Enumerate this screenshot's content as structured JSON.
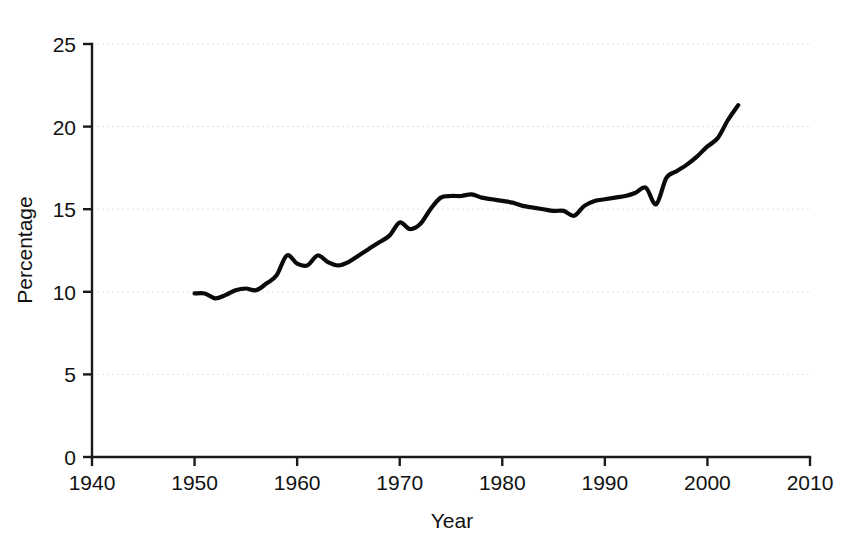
{
  "figure": {
    "caption_fragment": "",
    "background_color": "#ffffff",
    "line_color": "#0a0a0a",
    "grid_color": "#d8d8d8",
    "axis_color": "#1a1a1a"
  },
  "axes": {
    "x_title": "Year",
    "y_title": "Percentage",
    "x_ticks": [
      "1940",
      "1950",
      "1960",
      "1970",
      "1980",
      "1990",
      "2000",
      "2010"
    ],
    "y_ticks": [
      "0",
      "5",
      "10",
      "15",
      "20",
      "25"
    ]
  },
  "chart_data": {
    "type": "line",
    "title": "",
    "xlabel": "Year",
    "ylabel": "Percentage",
    "xlim": [
      1940,
      2010
    ],
    "ylim": [
      0,
      25
    ],
    "xticks": [
      1940,
      1950,
      1960,
      1970,
      1980,
      1990,
      2000,
      2010
    ],
    "yticks": [
      0,
      5,
      10,
      15,
      20,
      25
    ],
    "grid": true,
    "legend": "none",
    "series": [
      {
        "name": "Percentage",
        "x": [
          1950,
          1951,
          1952,
          1953,
          1954,
          1955,
          1956,
          1957,
          1958,
          1959,
          1960,
          1961,
          1962,
          1963,
          1964,
          1965,
          1966,
          1967,
          1968,
          1969,
          1970,
          1971,
          1972,
          1973,
          1974,
          1975,
          1976,
          1977,
          1978,
          1979,
          1980,
          1981,
          1982,
          1983,
          1984,
          1985,
          1986,
          1987,
          1988,
          1989,
          1990,
          1991,
          1992,
          1993,
          1994,
          1995,
          1996,
          1997,
          1998,
          1999,
          2000,
          2001,
          2002,
          2003
        ],
        "values": [
          9.9,
          9.9,
          9.6,
          9.8,
          10.1,
          10.2,
          10.1,
          10.5,
          11.0,
          12.2,
          11.7,
          11.6,
          12.2,
          11.8,
          11.6,
          11.8,
          12.2,
          12.6,
          13.0,
          13.4,
          14.2,
          13.8,
          14.1,
          15.0,
          15.7,
          15.8,
          15.8,
          15.9,
          15.7,
          15.6,
          15.5,
          15.4,
          15.2,
          15.1,
          15.0,
          14.9,
          14.9,
          14.6,
          15.2,
          15.5,
          15.6,
          15.7,
          15.8,
          16.0,
          16.3,
          15.3,
          16.9,
          17.3,
          17.7,
          18.2,
          18.8,
          19.3,
          20.4,
          21.3
        ]
      }
    ]
  }
}
